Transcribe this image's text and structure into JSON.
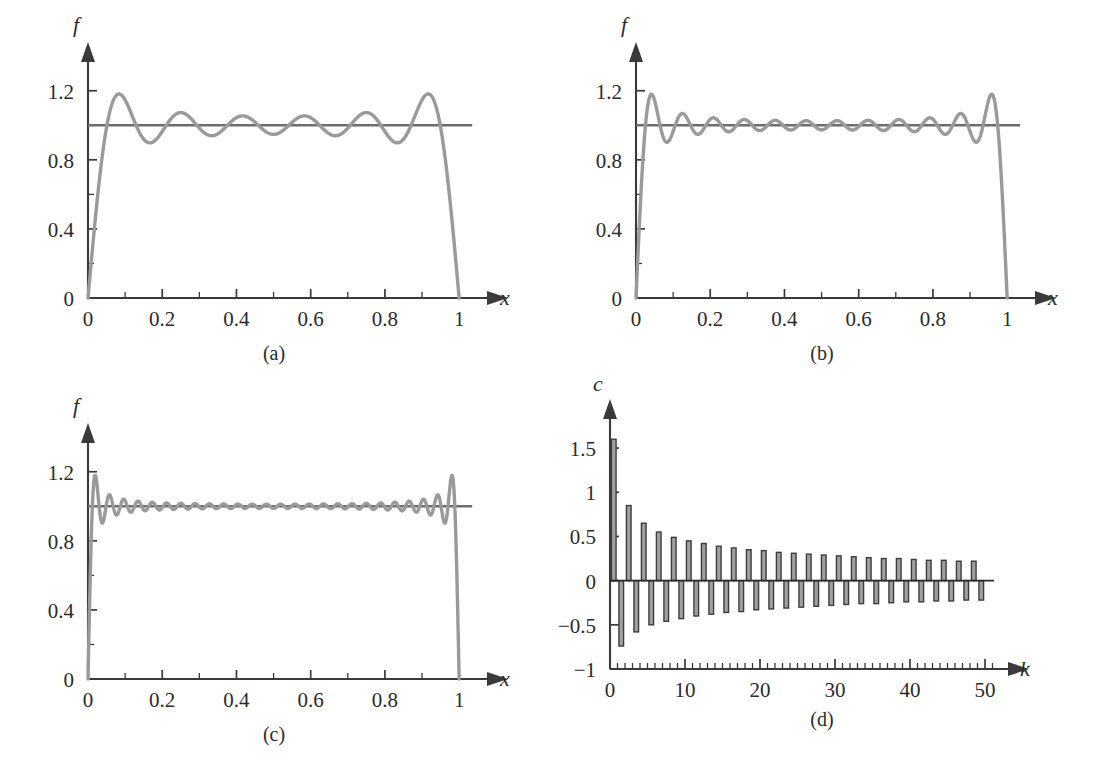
{
  "figure": {
    "name": "gibbs-phenomenon-figure",
    "background": "#ffffff",
    "curve_color": "#9a9a9a",
    "axis_color": "#3a3a3a",
    "bar_fill": "#a0a0a0",
    "bar_stroke": "#3d3d3d"
  },
  "panels": [
    {
      "id": "a",
      "caption": "(a)",
      "xlabel": "x",
      "ylabel": "f",
      "x_ticks": [
        0,
        0.2,
        0.4,
        0.6,
        0.8,
        1
      ],
      "x_ticklabels": [
        "0",
        "0.2",
        "0.4",
        "0.6",
        "0.8",
        "1"
      ],
      "x_minor_step": 0.1,
      "y_ticks": [
        0,
        0.2,
        0.4,
        0.6,
        0.8,
        1.0,
        1.2
      ],
      "y_ticklabels": [
        "0",
        "",
        "0.4",
        "",
        "0.8",
        "",
        "1.2"
      ],
      "xlim": [
        0,
        1.04
      ],
      "ylim": [
        0,
        1.32
      ],
      "n_terms": 6,
      "target_level": 1,
      "peak_overshoot": 1.2,
      "oscillation_count": 6
    },
    {
      "id": "b",
      "caption": "(b)",
      "xlabel": "x",
      "ylabel": "f",
      "x_ticks": [
        0,
        0.2,
        0.4,
        0.6,
        0.8,
        1
      ],
      "x_ticklabels": [
        "0",
        "0.2",
        "0.4",
        "0.6",
        "0.8",
        "1"
      ],
      "x_minor_step": 0.1,
      "y_ticks": [
        0,
        0.2,
        0.4,
        0.6,
        0.8,
        1.0,
        1.2
      ],
      "y_ticklabels": [
        "0",
        "",
        "0.4",
        "",
        "0.8",
        "",
        "1.2"
      ],
      "xlim": [
        0,
        1.04
      ],
      "ylim": [
        0,
        1.32
      ],
      "n_terms": 12,
      "target_level": 1,
      "peak_overshoot": 1.17,
      "oscillation_count": 12
    },
    {
      "id": "c",
      "caption": "(c)",
      "xlabel": "x",
      "ylabel": "f",
      "x_ticks": [
        0,
        0.2,
        0.4,
        0.6,
        0.8,
        1
      ],
      "x_ticklabels": [
        "0",
        "0.2",
        "0.4",
        "0.6",
        "0.8",
        "1"
      ],
      "x_minor_step": 0.1,
      "y_ticks": [
        0,
        0.2,
        0.4,
        0.6,
        0.8,
        1.0,
        1.2
      ],
      "y_ticklabels": [
        "0",
        "",
        "0.4",
        "",
        "0.8",
        "",
        "1.2"
      ],
      "xlim": [
        0,
        1.04
      ],
      "ylim": [
        0,
        1.32
      ],
      "n_terms": 26,
      "target_level": 1,
      "peak_overshoot": 1.18,
      "oscillation_count": 26
    },
    {
      "id": "d",
      "caption": "(d)",
      "xlabel": "k",
      "ylabel": "c",
      "x_ticks": [
        0,
        10,
        20,
        30,
        40,
        50
      ],
      "x_ticklabels": [
        "0",
        "10",
        "20",
        "30",
        "40",
        "50"
      ],
      "x_minor_step": 1,
      "y_ticks": [
        -1,
        -0.5,
        0,
        0.5,
        1,
        1.5
      ],
      "y_ticklabels": [
        "−1",
        "−0.5",
        "0",
        "0.5",
        "1",
        "1.5"
      ],
      "xlim": [
        0,
        52
      ],
      "ylim": [
        -1,
        1.75
      ]
    }
  ],
  "chart_data": [
    {
      "type": "line",
      "panel": "a",
      "title": "(a)",
      "xlabel": "x",
      "ylabel": "f",
      "xlim": [
        0,
        1.04
      ],
      "ylim": [
        0,
        1.32
      ],
      "xticks": [
        0,
        0.2,
        0.4,
        0.6,
        0.8,
        1
      ],
      "yticks": [
        0,
        0.4,
        0.8,
        1.2
      ],
      "grid": false,
      "legend": "none",
      "series": [
        {
          "name": "Fourier partial sum N=6",
          "description": "Partial Fourier sine sum approximating unit step on (0,1); Gibbs overshoot near both ends",
          "n_terms": 6,
          "peak_value": 1.2,
          "trough_value": 0.9,
          "drops_to_zero_at_x": 1
        },
        {
          "name": "Exact f = 1",
          "description": "Horizontal reference line at f = 1",
          "value": 1
        }
      ]
    },
    {
      "type": "line",
      "panel": "b",
      "title": "(b)",
      "xlabel": "x",
      "ylabel": "f",
      "xlim": [
        0,
        1.04
      ],
      "ylim": [
        0,
        1.32
      ],
      "xticks": [
        0,
        0.2,
        0.4,
        0.6,
        0.8,
        1
      ],
      "yticks": [
        0,
        0.4,
        0.8,
        1.2
      ],
      "grid": false,
      "legend": "none",
      "series": [
        {
          "name": "Fourier partial sum N=12",
          "description": "More terms: ripples are narrower and denser, overshoot height persists",
          "n_terms": 12,
          "peak_value": 1.17,
          "trough_value": 0.92,
          "drops_to_zero_at_x": 1
        },
        {
          "name": "Exact f = 1",
          "value": 1
        }
      ]
    },
    {
      "type": "line",
      "panel": "c",
      "title": "(c)",
      "xlabel": "x",
      "ylabel": "f",
      "xlim": [
        0,
        1.04
      ],
      "ylim": [
        0,
        1.32
      ],
      "xticks": [
        0,
        0.2,
        0.4,
        0.6,
        0.8,
        1
      ],
      "yticks": [
        0,
        0.4,
        0.8,
        1.2
      ],
      "grid": false,
      "legend": "none",
      "series": [
        {
          "name": "Fourier partial sum N=26",
          "description": "Many terms: ripples compress toward the discontinuity but overshoot remains ~18%",
          "n_terms": 26,
          "peak_value": 1.18,
          "trough_value": 0.9,
          "drops_to_zero_at_x": 1
        },
        {
          "name": "Exact f = 1",
          "value": 1
        }
      ]
    },
    {
      "type": "bar",
      "panel": "d",
      "title": "(d)",
      "xlabel": "k",
      "ylabel": "c",
      "xlim": [
        0,
        52
      ],
      "ylim": [
        -1,
        1.75
      ],
      "xticks": [
        0,
        10,
        20,
        30,
        40,
        50
      ],
      "yticks": [
        -1,
        -0.5,
        0,
        0.5,
        1,
        1.5
      ],
      "grid": false,
      "legend": "none",
      "description": "Fourier coefficients c_k alternating in sign with magnitude decaying like 1/k",
      "categories": [
        1,
        2,
        3,
        4,
        5,
        6,
        7,
        8,
        9,
        10,
        11,
        12,
        13,
        14,
        15,
        16,
        17,
        18,
        19,
        20,
        21,
        22,
        23,
        24,
        25,
        26,
        27,
        28,
        29,
        30,
        31,
        32,
        33,
        34,
        35,
        36,
        37,
        38,
        39,
        40,
        41,
        42,
        43,
        44,
        45,
        46,
        47,
        48,
        49,
        50
      ],
      "values": [
        1.6,
        -0.74,
        0.85,
        -0.58,
        0.65,
        -0.5,
        0.55,
        -0.46,
        0.49,
        -0.43,
        0.45,
        -0.4,
        0.42,
        -0.38,
        0.39,
        -0.36,
        0.37,
        -0.35,
        0.35,
        -0.33,
        0.34,
        -0.32,
        0.32,
        -0.31,
        0.31,
        -0.3,
        0.3,
        -0.29,
        0.29,
        -0.28,
        0.28,
        -0.27,
        0.27,
        -0.26,
        0.26,
        -0.26,
        0.25,
        -0.25,
        0.25,
        -0.24,
        0.24,
        -0.24,
        0.23,
        -0.23,
        0.23,
        -0.23,
        0.22,
        -0.22,
        0.22,
        -0.22
      ]
    }
  ]
}
